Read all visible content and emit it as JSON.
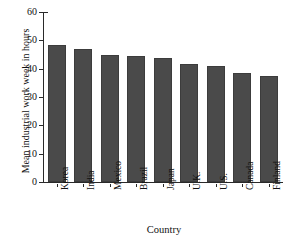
{
  "chart_data": {
    "type": "bar",
    "title": "",
    "xlabel": "Country",
    "ylabel": "Mean industrial work week in hours",
    "categories": [
      "Korea",
      "India",
      "Mexico",
      "Brazil",
      "Japan",
      "U.K.",
      "U.S.",
      "Canada",
      "Finland"
    ],
    "values": [
      48.5,
      47.0,
      44.8,
      44.4,
      43.6,
      41.6,
      40.8,
      38.6,
      37.5
    ],
    "ylim": [
      0,
      60
    ],
    "yticks": [
      0,
      10,
      20,
      30,
      40,
      50,
      60
    ],
    "ytick_labels": [
      "0",
      "10",
      "20",
      "30",
      "40",
      "50",
      "60"
    ],
    "grid": false,
    "legend": false,
    "bar_color": "#4a4a4a",
    "axis_color": "#2a2a2a",
    "background": "#ffffff"
  },
  "figure": {
    "clipped_top_title": ""
  }
}
